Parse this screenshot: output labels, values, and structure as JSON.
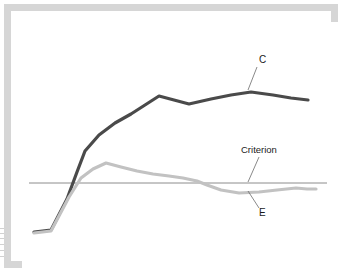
{
  "figure": {
    "frame_color": "#d6d6d6",
    "background_color": "#ffffff",
    "plot_background": "#ffffff"
  },
  "labels": {
    "criterion": "Criterion",
    "series_c": "C",
    "series_e": "E"
  },
  "chart_data": {
    "type": "line",
    "title": "",
    "subtitle": "",
    "xlabel": "",
    "ylabel": "",
    "grid": false,
    "legend_position": "inline-annotations",
    "xlim": [
      0,
      320
    ],
    "ylim": [
      0,
      250
    ],
    "y_axis_direction": "inverted-pixel",
    "annotations": [
      {
        "text": "C",
        "name": "series-c-annotation",
        "x": 248,
        "y": 52,
        "leader_from": [
          246,
          56
        ],
        "leader_to": [
          237,
          79
        ]
      },
      {
        "text": "Criterion",
        "name": "criterion-annotation",
        "x": 230,
        "y": 142,
        "leader_from": [
          248,
          146
        ],
        "leader_to": [
          237,
          171
        ]
      },
      {
        "text": "E",
        "name": "series-e-annotation",
        "x": 248,
        "y": 205,
        "leader_from": [
          248,
          197
        ],
        "leader_to": [
          237,
          180
        ]
      }
    ],
    "reference_lines": [
      {
        "name": "criterion",
        "label": "Criterion",
        "orientation": "horizontal",
        "y": 172,
        "x_start": 18,
        "x_end": 316,
        "color": "#8c8c8c",
        "width": 1
      }
    ],
    "series": [
      {
        "name": "C",
        "label": "C",
        "color": "#4a4a4a",
        "width": 3.2,
        "points": [
          [
            23,
            221
          ],
          [
            40,
            219
          ],
          [
            56,
            188
          ],
          [
            66,
            161
          ],
          [
            74,
            140
          ],
          [
            88,
            124
          ],
          [
            104,
            112
          ],
          [
            120,
            103
          ],
          [
            134,
            94
          ],
          [
            148,
            85
          ],
          [
            163,
            89
          ],
          [
            178,
            93
          ],
          [
            200,
            88
          ],
          [
            220,
            84
          ],
          [
            240,
            81
          ],
          [
            262,
            84
          ],
          [
            280,
            87
          ],
          [
            297,
            89
          ]
        ]
      },
      {
        "name": "E",
        "label": "E",
        "color": "#c2c2c2",
        "width": 3.2,
        "points": [
          [
            23,
            222
          ],
          [
            40,
            220
          ],
          [
            58,
            186
          ],
          [
            70,
            167
          ],
          [
            82,
            158
          ],
          [
            95,
            152
          ],
          [
            110,
            156
          ],
          [
            126,
            160
          ],
          [
            142,
            163
          ],
          [
            158,
            165
          ],
          [
            172,
            167
          ],
          [
            186,
            170
          ],
          [
            196,
            174
          ],
          [
            210,
            179
          ],
          [
            228,
            182
          ],
          [
            248,
            181
          ],
          [
            266,
            179
          ],
          [
            285,
            177
          ],
          [
            296,
            178
          ],
          [
            305,
            178
          ]
        ]
      }
    ]
  },
  "edge_artifacts": {
    "name": "scan-edge-artifacts",
    "marks": [
      0,
      5,
      10,
      16,
      22,
      28
    ]
  }
}
